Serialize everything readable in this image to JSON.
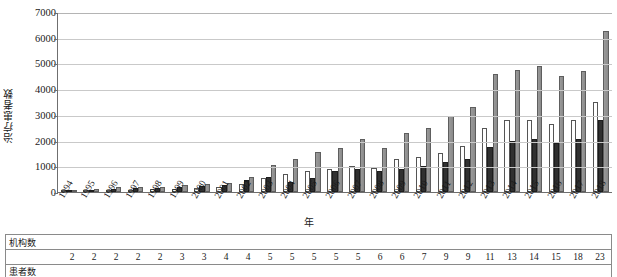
{
  "chart_data": {
    "type": "bar",
    "title": "",
    "xlabel": "年",
    "ylabel": "治疗患者数",
    "ylim": [
      0,
      7000
    ],
    "ytick_values": [
      7000,
      6000,
      5000,
      4000,
      3000,
      2000,
      1000,
      0
    ],
    "ytick_labels": [
      "7000",
      "6000",
      "5000",
      "4000",
      "3000",
      "2000",
      "1000",
      "0"
    ],
    "grid": true,
    "legend": "none",
    "categories": [
      "1994",
      "1995",
      "1996",
      "1997",
      "1998",
      "1999",
      "2000",
      "2001",
      "2002",
      "2003",
      "2004",
      "2005",
      "2006",
      "2007",
      "2008",
      "2009",
      "2010",
      "2011",
      "2012",
      "2013",
      "2014",
      "2015",
      "2016",
      "2017",
      "2018"
    ],
    "series": [
      {
        "name": "series-1",
        "color": "#ffffff",
        "values": [
          20,
          60,
          70,
          60,
          110,
          120,
          160,
          200,
          330,
          530,
          700,
          800,
          900,
          1000,
          950,
          1300,
          1350,
          1500,
          1800,
          2500,
          2800,
          2800,
          2650,
          2800,
          3500
        ]
      },
      {
        "name": "series-2",
        "color": "#303030",
        "values": [
          30,
          90,
          120,
          140,
          170,
          200,
          230,
          280,
          450,
          600,
          400,
          550,
          800,
          900,
          800,
          900,
          1000,
          1150,
          1300,
          1750,
          2000,
          2050,
          1900,
          2050,
          2800
        ]
      },
      {
        "name": "series-3",
        "color": "#8f8f8f",
        "values": [
          50,
          130,
          180,
          210,
          190,
          280,
          300,
          350,
          570,
          1050,
          1300,
          1550,
          1700,
          2050,
          1700,
          2300,
          2500,
          2950,
          3300,
          4600,
          4750,
          4900,
          4500,
          4700,
          6250
        ]
      }
    ]
  },
  "table": {
    "rows": [
      {
        "label": "机构数",
        "values": [
          "2",
          "2",
          "2",
          "2",
          "2",
          "3",
          "3",
          "4",
          "4",
          "5",
          "5",
          "5",
          "5",
          "5",
          "6",
          "6",
          "7",
          "9",
          "9",
          "11",
          "13",
          "14",
          "15",
          "18",
          "23"
        ]
      },
      {
        "label": "患者数",
        "values": []
      }
    ]
  }
}
